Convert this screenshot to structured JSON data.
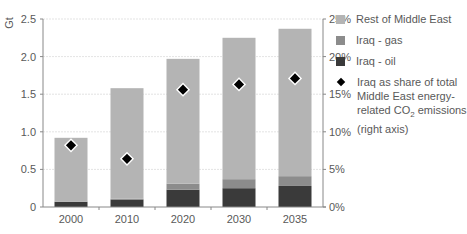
{
  "chart_data": {
    "type": "bar",
    "stacked": true,
    "title": "",
    "categories": [
      "2000",
      "2010",
      "2020",
      "2030",
      "2035"
    ],
    "series": [
      {
        "name": "Iraq - oil",
        "axis": "left",
        "color": "#3a3a3a",
        "values": [
          0.07,
          0.1,
          0.23,
          0.25,
          0.28
        ]
      },
      {
        "name": "Iraq - gas",
        "axis": "left",
        "color": "#8c8c8c",
        "values": [
          0.0,
          0.01,
          0.08,
          0.12,
          0.13
        ]
      },
      {
        "name": "Rest of Middle East",
        "axis": "left",
        "color": "#b4b4b4",
        "values": [
          0.85,
          1.47,
          1.66,
          1.88,
          1.96
        ]
      },
      {
        "name": "Iraq as share of total Middle East energy-related CO₂ emissions (right axis)",
        "axis": "right",
        "type": "scatter",
        "marker": "diamond",
        "color": "#000000",
        "values": [
          8.2,
          6.4,
          15.6,
          16.3,
          17.1
        ]
      }
    ],
    "ylabel": "Gt",
    "ylim": [
      0,
      2.5
    ],
    "yticks": [
      "0",
      "0.5",
      "1.0",
      "1.5",
      "2.0",
      "2.5"
    ],
    "y2lim": [
      0,
      25
    ],
    "y2ticks": [
      "0%",
      "5%",
      "10%",
      "15%",
      "20%",
      "25%"
    ],
    "grid": true,
    "legend_position": "right"
  },
  "legend": {
    "items": [
      {
        "label": "Rest of Middle East",
        "color": "#b4b4b4"
      },
      {
        "label": "Iraq - gas",
        "color": "#8c8c8c"
      },
      {
        "label": "Iraq - oil",
        "color": "#3a3a3a"
      }
    ],
    "share_label_line1": "Iraq as share of total Middle East energy-related CO",
    "share_label_sub": "2",
    "share_label_line2": " emissions (right axis)"
  }
}
